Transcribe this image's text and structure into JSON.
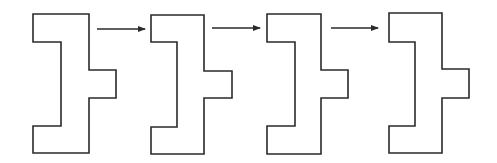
{
  "diagram": {
    "stroke_color": "#2a2a2a",
    "background": "#ffffff",
    "shapes": [
      {
        "id": "shape-1",
        "left": 33,
        "inner": 61,
        "right": 89,
        "protrusion": 116,
        "top": 14,
        "notch_top": 42,
        "prot_top": 70,
        "prot_bottom": 98,
        "notch_bottom": 126,
        "bottom": 153
      },
      {
        "id": "shape-2",
        "left": 151,
        "inner": 177,
        "right": 204,
        "protrusion": 232,
        "top": 15,
        "notch_top": 42,
        "prot_top": 71,
        "prot_bottom": 98,
        "notch_bottom": 127,
        "bottom": 154
      },
      {
        "id": "shape-3",
        "left": 267,
        "inner": 295,
        "right": 321,
        "protrusion": 348,
        "top": 14,
        "notch_top": 42,
        "prot_top": 70,
        "prot_bottom": 98,
        "notch_bottom": 126,
        "bottom": 154
      },
      {
        "id": "shape-4",
        "left": 389,
        "inner": 415,
        "right": 442,
        "protrusion": 469,
        "top": 13,
        "notch_top": 42,
        "prot_top": 69,
        "prot_bottom": 98,
        "notch_bottom": 126,
        "bottom": 153
      }
    ],
    "arrows": [
      {
        "id": "arrow-1",
        "x1": 97,
        "x2": 145,
        "y": 29
      },
      {
        "id": "arrow-2",
        "x1": 212,
        "x2": 260,
        "y": 28
      },
      {
        "id": "arrow-3",
        "x1": 331,
        "x2": 378,
        "y": 28
      }
    ]
  }
}
